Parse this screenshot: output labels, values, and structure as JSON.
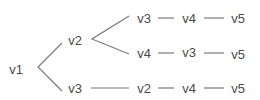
{
  "diagram": {
    "root": "v1",
    "nodes": [
      {
        "id": "n_v1",
        "label": "v1",
        "x": 16,
        "y": 69
      },
      {
        "id": "n_v2",
        "label": "v2",
        "x": 75,
        "y": 40
      },
      {
        "id": "n_v3b",
        "label": "v3",
        "x": 75,
        "y": 88
      },
      {
        "id": "n_r1c1",
        "label": "v3",
        "x": 144,
        "y": 18
      },
      {
        "id": "n_r1c2",
        "label": "v4",
        "x": 188,
        "y": 18
      },
      {
        "id": "n_r1c3",
        "label": "v5",
        "x": 238,
        "y": 18
      },
      {
        "id": "n_r2c1",
        "label": "v4",
        "x": 144,
        "y": 53
      },
      {
        "id": "n_r2c2",
        "label": "v3",
        "x": 188,
        "y": 52
      },
      {
        "id": "n_r2c3",
        "label": "v5",
        "x": 238,
        "y": 54
      },
      {
        "id": "n_r3c1",
        "label": "v2",
        "x": 144,
        "y": 88
      },
      {
        "id": "n_r3c2",
        "label": "v4",
        "x": 188,
        "y": 88
      },
      {
        "id": "n_r3c3",
        "label": "v5",
        "x": 238,
        "y": 88
      }
    ],
    "paths": [
      [
        "v1",
        "v2",
        "v3",
        "v4",
        "v5"
      ],
      [
        "v1",
        "v2",
        "v4",
        "v3",
        "v5"
      ],
      [
        "v1",
        "v3",
        "v2",
        "v4",
        "v5"
      ]
    ],
    "edge_color": "#7a7a7a",
    "text_color": "#4a4a4a"
  }
}
